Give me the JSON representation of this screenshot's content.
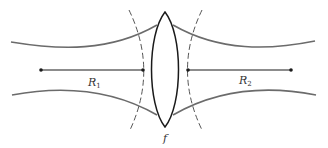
{
  "diagram": {
    "type": "optics-gaussian-beam-lens",
    "colors": {
      "beam": "#6b6b6b",
      "lens": "#1a1a1a",
      "radius_line": "#1a1a1a",
      "wavefront": "#555555",
      "background": "#ffffff"
    },
    "labels": {
      "r1_main": "R",
      "r1_sub": "1",
      "r2_main": "R",
      "r2_sub": "2",
      "focal": "f"
    },
    "elements": [
      {
        "id": "beam-left",
        "description": "Gaussian beam envelope converging toward lens from left"
      },
      {
        "id": "beam-right",
        "description": "Gaussian beam envelope diverging from lens to right"
      },
      {
        "id": "lens",
        "description": "Biconvex thin lens with focal length f"
      },
      {
        "id": "wavefront-left",
        "description": "Dashed curved wavefront with radius R1 at left of lens"
      },
      {
        "id": "wavefront-right",
        "description": "Dashed curved wavefront with radius R2 at right of lens"
      },
      {
        "id": "radius-r1",
        "description": "Radius of curvature line R1 from center point to wavefront"
      },
      {
        "id": "radius-r2",
        "description": "Radius of curvature line R2 from wavefront to center point"
      }
    ]
  }
}
